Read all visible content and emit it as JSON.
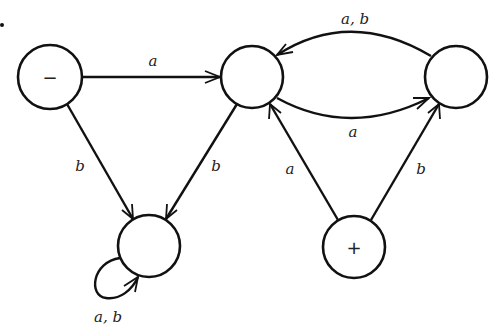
{
  "diagram": {
    "type": "finite-automaton",
    "states": [
      {
        "id": "s1",
        "mark": "−",
        "role": "start",
        "cx": 50,
        "cy": 77
      },
      {
        "id": "s2",
        "mark": "",
        "role": "normal",
        "cx": 252,
        "cy": 77
      },
      {
        "id": "s3",
        "mark": "",
        "role": "normal",
        "cx": 456,
        "cy": 77
      },
      {
        "id": "s4",
        "mark": "",
        "role": "dead",
        "cx": 149,
        "cy": 246
      },
      {
        "id": "s5",
        "mark": "+",
        "role": "final",
        "cx": 354,
        "cy": 247
      }
    ],
    "edges": [
      {
        "from": "s1",
        "to": "s2",
        "label": "a"
      },
      {
        "from": "s1",
        "to": "s4",
        "label": "b"
      },
      {
        "from": "s2",
        "to": "s4",
        "label": "b"
      },
      {
        "from": "s2",
        "to": "s3",
        "label": "a"
      },
      {
        "from": "s3",
        "to": "s2",
        "label": "a, b"
      },
      {
        "from": "s5",
        "to": "s2",
        "label": "a"
      },
      {
        "from": "s5",
        "to": "s3",
        "label": "b"
      },
      {
        "from": "s4",
        "to": "s4",
        "label": "a, b"
      }
    ]
  }
}
